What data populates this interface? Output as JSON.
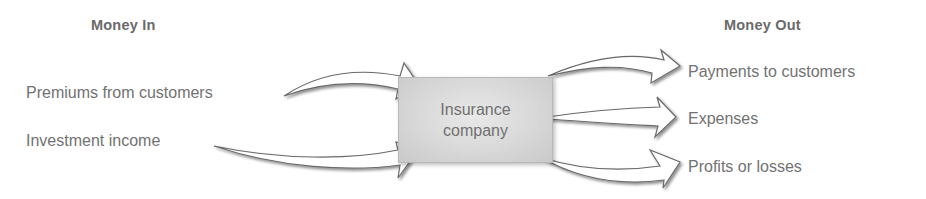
{
  "diagram": {
    "money_in": {
      "heading": "Money In",
      "items": [
        "Premiums from customers",
        "Investment income"
      ]
    },
    "center": {
      "label_line1": "Insurance",
      "label_line2": "company"
    },
    "money_out": {
      "heading": "Money Out",
      "items": [
        "Payments to customers",
        "Expenses",
        "Profits or losses"
      ]
    },
    "colors": {
      "text": "#707070",
      "box_fill": "#d8d8d8",
      "arrow_stroke": "#6a6a6a",
      "arrow_fill": "#ffffff"
    }
  }
}
